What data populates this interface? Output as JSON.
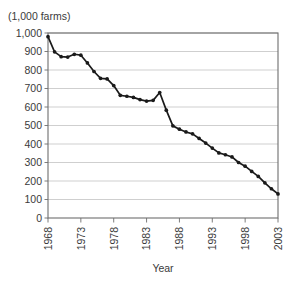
{
  "figure": {
    "y_unit_label": "(1,000 farms)",
    "x_axis_title": "Year"
  },
  "chart_data": {
    "type": "line",
    "title": "",
    "subtitle": "",
    "xlabel": "Year",
    "ylabel": "(1,000 farms)",
    "xlim": [
      1968,
      2003
    ],
    "ylim": [
      0,
      1000
    ],
    "grid": true,
    "legend": false,
    "legend_position": "none",
    "marker": "filled-circle",
    "line_color": "#1a1a1a",
    "grid_color": "#c9c9c9",
    "axis_color": "#6e6e6e",
    "y_ticks": [
      0,
      100,
      200,
      300,
      400,
      500,
      600,
      700,
      800,
      900,
      1000
    ],
    "y_tick_labels": [
      "0",
      "100",
      "200",
      "300",
      "400",
      "500",
      "600",
      "700",
      "800",
      "900",
      "1,000"
    ],
    "x_ticks": [
      1968,
      1973,
      1978,
      1983,
      1988,
      1993,
      1998,
      2003
    ],
    "x_tick_labels": [
      "1968",
      "1973",
      "1978",
      "1983",
      "1988",
      "1993",
      "1998",
      "2003"
    ],
    "x": [
      1968,
      1969,
      1970,
      1971,
      1972,
      1973,
      1974,
      1975,
      1976,
      1977,
      1978,
      1979,
      1980,
      1981,
      1982,
      1983,
      1984,
      1985,
      1986,
      1987,
      1988,
      1989,
      1990,
      1991,
      1992,
      1993,
      1994,
      1995,
      1996,
      1997,
      1998,
      1999,
      2000,
      2001,
      2002,
      2003
    ],
    "values": [
      980,
      905,
      870,
      872,
      880,
      878,
      840,
      790,
      755,
      752,
      715,
      665,
      660,
      655,
      650,
      645,
      640,
      675,
      580,
      500,
      487,
      478,
      462,
      440,
      420,
      400,
      385,
      370,
      368,
      352,
      335,
      318,
      300,
      283,
      268,
      255
    ],
    "series": [
      {
        "name": "Farms",
        "units": "1,000 farms",
        "points": [
          {
            "year": 1968,
            "value": 980
          },
          {
            "year": 1969,
            "value": 900
          },
          {
            "year": 1970,
            "value": 872
          },
          {
            "year": 1971,
            "value": 870
          },
          {
            "year": 1972,
            "value": 882
          },
          {
            "year": 1973,
            "value": 878
          },
          {
            "year": 1974,
            "value": 838
          },
          {
            "year": 1975,
            "value": 790
          },
          {
            "year": 1976,
            "value": 752
          },
          {
            "year": 1977,
            "value": 750
          },
          {
            "year": 1978,
            "value": 712
          },
          {
            "year": 1979,
            "value": 662
          },
          {
            "year": 1980,
            "value": 658
          },
          {
            "year": 1981,
            "value": 648
          },
          {
            "year": 1982,
            "value": 640
          },
          {
            "year": 1983,
            "value": 630
          },
          {
            "year": 1984,
            "value": 642
          },
          {
            "year": 1985,
            "value": 675
          },
          {
            "year": 1986,
            "value": 580
          },
          {
            "year": 1987,
            "value": 495
          },
          {
            "year": 1988,
            "value": 478
          },
          {
            "year": 1989,
            "value": 460
          },
          {
            "year": 1990,
            "value": 452
          },
          {
            "year": 1991,
            "value": 430
          },
          {
            "year": 1992,
            "value": 408
          },
          {
            "year": 1993,
            "value": 380
          },
          {
            "year": 1994,
            "value": 352
          },
          {
            "year": 1995,
            "value": 340
          },
          {
            "year": 1996,
            "value": 330
          },
          {
            "year": 1997,
            "value": 300
          },
          {
            "year": 1998,
            "value": 282
          },
          {
            "year": 1999,
            "value": 255
          },
          {
            "year": 2000,
            "value": 228
          },
          {
            "year": 2001,
            "value": 190
          },
          {
            "year": 2002,
            "value": 160
          },
          {
            "year": 2003,
            "value": 130
          }
        ]
      }
    ],
    "plot_geometry": {
      "left": 48,
      "right": 278,
      "top": 33,
      "bottom": 218
    },
    "data_plot": [
      {
        "year": 1968,
        "value": 980
      },
      {
        "year": 1969,
        "value": 898
      },
      {
        "year": 1970,
        "value": 872
      },
      {
        "year": 1971,
        "value": 870
      },
      {
        "year": 1972,
        "value": 885
      },
      {
        "year": 1973,
        "value": 880
      },
      {
        "year": 1974,
        "value": 838
      },
      {
        "year": 1975,
        "value": 792
      },
      {
        "year": 1976,
        "value": 755
      },
      {
        "year": 1977,
        "value": 752
      },
      {
        "year": 1978,
        "value": 716
      },
      {
        "year": 1979,
        "value": 663
      },
      {
        "year": 1980,
        "value": 658
      },
      {
        "year": 1981,
        "value": 652
      },
      {
        "year": 1982,
        "value": 640
      },
      {
        "year": 1983,
        "value": 632
      },
      {
        "year": 1984,
        "value": 636
      },
      {
        "year": 1985,
        "value": 678
      },
      {
        "year": 1986,
        "value": 583
      },
      {
        "year": 1987,
        "value": 498
      },
      {
        "year": 1988,
        "value": 480
      },
      {
        "year": 1989,
        "value": 465
      },
      {
        "year": 1990,
        "value": 455
      },
      {
        "year": 1991,
        "value": 430
      },
      {
        "year": 1992,
        "value": 405
      },
      {
        "year": 1993,
        "value": 378
      },
      {
        "year": 1994,
        "value": 352
      },
      {
        "year": 1995,
        "value": 342
      },
      {
        "year": 1996,
        "value": 330
      },
      {
        "year": 1997,
        "value": 300
      },
      {
        "year": 1998,
        "value": 280
      },
      {
        "year": 1999,
        "value": 252
      },
      {
        "year": 2000,
        "value": 225
      },
      {
        "year": 2001,
        "value": 190
      },
      {
        "year": 2002,
        "value": 158
      },
      {
        "year": 2003,
        "value": 130
      }
    ]
  }
}
